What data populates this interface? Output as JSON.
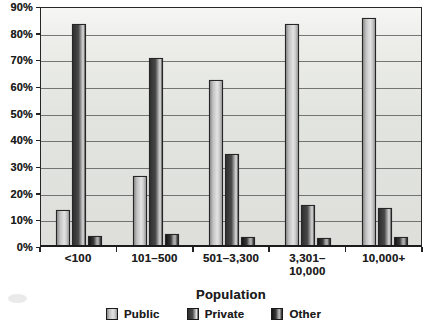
{
  "chart_data": {
    "type": "bar",
    "title": "",
    "xlabel": "Population",
    "ylabel": "",
    "categories": [
      "<100",
      "101–500",
      "501–3,300",
      "3,301–10,000",
      "10,000+"
    ],
    "tick_labels": [
      "<100",
      "101–500",
      "501–3,300",
      "3,301–\n10,000",
      "10,000+"
    ],
    "series": [
      {
        "name": "Public",
        "values": [
          13,
          26,
          62,
          83,
          85
        ]
      },
      {
        "name": "Private",
        "values": [
          83,
          70,
          34,
          15,
          14
        ]
      },
      {
        "name": "Other",
        "values": [
          3.5,
          4,
          3,
          2.5,
          3
        ]
      }
    ],
    "ylim": [
      0,
      90
    ],
    "ytick_step": 10,
    "ytick_labels": [
      "0%",
      "10%",
      "20%",
      "30%",
      "40%",
      "50%",
      "60%",
      "70%",
      "80%",
      "90%"
    ],
    "grid": true,
    "legend_position": "bottom",
    "legend_entries": [
      "Public",
      "Private",
      "Other"
    ]
  },
  "colors": {
    "plot_background": "#e2e4e0",
    "gridline": "#4d4d4d",
    "axis": "#262626",
    "text": "#1d1d1d",
    "series_gradients": {
      "Public": [
        "#898989 0%",
        "#c2c2c2 25%",
        "#e3e3e3 60%",
        "#c9c9c9 80%",
        "#969696 100%"
      ],
      "Private": [
        "#2f2f2f 0%",
        "#484848 45%",
        "#b9b9b9 75%",
        "#dedede 85%",
        "#565656 100%"
      ],
      "Other": [
        "#141414 0%",
        "#3a3a3a 40%",
        "#9e9e9e 62%",
        "#b5b5b5 76%",
        "#222222 100%"
      ]
    }
  }
}
